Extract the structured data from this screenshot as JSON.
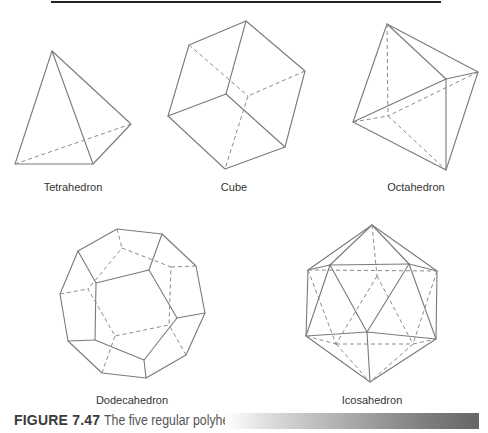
{
  "figure": {
    "caption_label": "FIGURE 7.47",
    "caption_text": "The five regular polyhedra."
  },
  "shapes": [
    {
      "name": "Tetrahedron"
    },
    {
      "name": "Cube"
    },
    {
      "name": "Octahedron"
    },
    {
      "name": "Dodecahedron"
    },
    {
      "name": "Icosahedron"
    }
  ]
}
